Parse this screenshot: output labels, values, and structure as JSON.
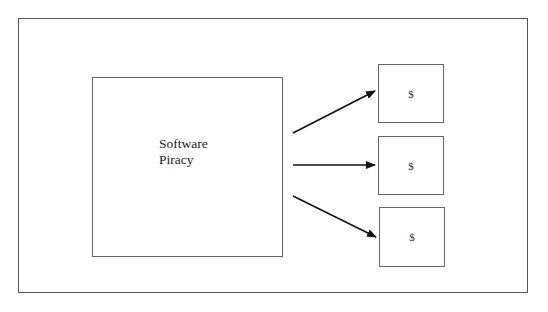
{
  "diagram": {
    "main": {
      "line1": "Software",
      "line2": "Piracy"
    },
    "outputs": [
      {
        "label": "$"
      },
      {
        "label": "$"
      },
      {
        "label": "$"
      }
    ],
    "arrows": [
      {
        "from": "main",
        "to": "output-1",
        "direction": "up-right"
      },
      {
        "from": "main",
        "to": "output-2",
        "direction": "right"
      },
      {
        "from": "main",
        "to": "output-3",
        "direction": "down-right"
      }
    ],
    "colors": {
      "line": "#555555",
      "arrow": "#111111",
      "background": "#ffffff"
    }
  }
}
